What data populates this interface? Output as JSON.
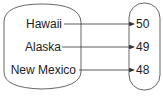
{
  "diagram": {
    "type": "mapping",
    "domain": {
      "items": [
        "Hawaii",
        "Alaska",
        "New Mexico"
      ]
    },
    "range": {
      "items": [
        "50",
        "49",
        "48"
      ]
    },
    "mappings": [
      {
        "from": "Hawaii",
        "to": "50"
      },
      {
        "from": "Alaska",
        "to": "49"
      },
      {
        "from": "New Mexico",
        "to": "48"
      }
    ],
    "colors": {
      "stroke": "#555555",
      "text": "#222222",
      "background": "#ffffff"
    }
  }
}
